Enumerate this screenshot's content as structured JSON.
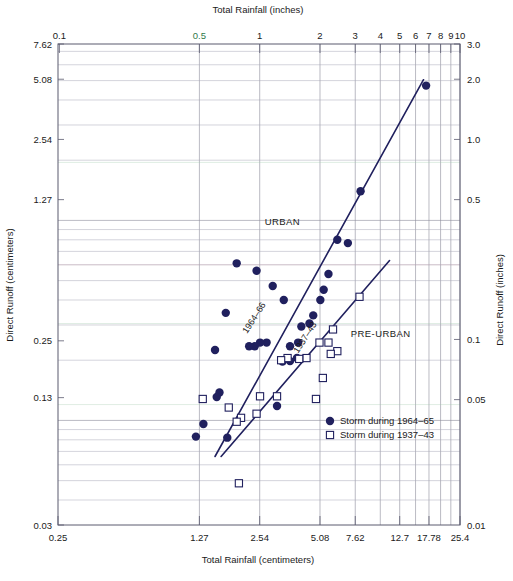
{
  "chart_data": {
    "type": "scatter",
    "title": "",
    "xlabel": "Total Rainfall (centimeters)",
    "xlabel_top": "Total Rainfall (inches)",
    "ylabel": "Direct Runoff (centimeters)",
    "ylabel_right": "Direct Runoff (inches)",
    "xscale": "log",
    "yscale": "log",
    "grid": true,
    "legend_position": "bottom-right",
    "xlim_cm": [
      0.25,
      25.4
    ],
    "ylim_cm": [
      0.03,
      7.62
    ],
    "xlim_in": [
      0.1,
      10
    ],
    "ylim_in": [
      0.01,
      3.0
    ],
    "x_ticks_bottom": [
      "0.25",
      "1.27",
      "2.54",
      "5.08",
      "7.62",
      "12.7",
      "17.78",
      "25.4"
    ],
    "x_ticks_bottom_vals": [
      0.25,
      1.27,
      2.54,
      5.08,
      7.62,
      12.7,
      17.78,
      25.4
    ],
    "x_ticks_top": [
      "0.1",
      "0.5",
      "1",
      "2",
      "3",
      "4",
      "5",
      "6",
      "7",
      "8",
      "9",
      "10"
    ],
    "x_ticks_top_vals": [
      0.1,
      0.5,
      1,
      2,
      3,
      4,
      5,
      6,
      7,
      8,
      9,
      10
    ],
    "y_ticks_left": [
      "7.62",
      "5.08",
      "2.54",
      "1.27",
      "0.25",
      "0.13",
      "0.03"
    ],
    "y_ticks_left_vals": [
      7.62,
      5.08,
      2.54,
      1.27,
      0.25,
      0.13,
      0.03
    ],
    "y_ticks_right": [
      "3.0",
      "2.0",
      "1.0",
      "0.5",
      "0.1",
      "0.05",
      "0.01"
    ],
    "y_ticks_right_vals": [
      3.0,
      2.0,
      1.0,
      0.5,
      0.1,
      0.05,
      0.01
    ],
    "annotations": [
      {
        "text": "URBAN",
        "x_cm": 3.3,
        "y_cm": 0.95
      },
      {
        "text": "PRE-URBAN",
        "x_cm": 10.2,
        "y_cm": 0.26
      },
      {
        "text": "1964–66",
        "x_cm": 2.45,
        "y_cm": 0.32,
        "rotated": true
      },
      {
        "text": "1937–43",
        "x_cm": 4.4,
        "y_cm": 0.255,
        "rotated": true
      }
    ],
    "series": [
      {
        "name": "Storm during 1964–65",
        "marker": "filled-circle",
        "color": "#20205e",
        "points_cm": [
          [
            17.2,
            4.72
          ],
          [
            8.1,
            1.4
          ],
          [
            7.0,
            0.77
          ],
          [
            6.2,
            0.8
          ],
          [
            5.6,
            0.54
          ],
          [
            5.3,
            0.45
          ],
          [
            5.1,
            0.4
          ],
          [
            4.7,
            0.335
          ],
          [
            4.5,
            0.305
          ],
          [
            4.1,
            0.295
          ],
          [
            3.95,
            0.245
          ],
          [
            3.6,
            0.235
          ],
          [
            3.9,
            0.205
          ],
          [
            3.6,
            0.198
          ],
          [
            3.3,
            0.197
          ],
          [
            2.95,
            0.47
          ],
          [
            3.35,
            0.4
          ],
          [
            2.45,
            0.56
          ],
          [
            1.95,
            0.61
          ],
          [
            2.75,
            0.245
          ],
          [
            2.55,
            0.245
          ],
          [
            2.4,
            0.235
          ],
          [
            2.25,
            0.235
          ],
          [
            1.72,
            0.345
          ],
          [
            1.52,
            0.225
          ],
          [
            3.1,
            0.118
          ],
          [
            1.6,
            0.138
          ],
          [
            1.55,
            0.131
          ],
          [
            1.33,
            0.096
          ],
          [
            1.22,
            0.083
          ],
          [
            1.75,
            0.082
          ]
        ]
      },
      {
        "name": "Storm during 1937–43",
        "marker": "open-square",
        "color": "#20205e",
        "points_cm": [
          [
            8.0,
            0.415
          ],
          [
            5.9,
            0.285
          ],
          [
            5.05,
            0.245
          ],
          [
            5.6,
            0.245
          ],
          [
            6.2,
            0.222
          ],
          [
            5.75,
            0.215
          ],
          [
            5.25,
            0.163
          ],
          [
            4.35,
            0.205
          ],
          [
            4.0,
            0.203
          ],
          [
            4.85,
            0.128
          ],
          [
            3.5,
            0.205
          ],
          [
            3.25,
            0.2
          ],
          [
            3.1,
            0.132
          ],
          [
            2.55,
            0.132
          ],
          [
            2.45,
            0.108
          ],
          [
            2.05,
            0.103
          ],
          [
            1.78,
            0.116
          ],
          [
            1.32,
            0.128
          ],
          [
            1.95,
            0.0985
          ],
          [
            2.0,
            0.0485
          ]
        ]
      }
    ],
    "fit_lines": [
      {
        "name": "urban-1964-66",
        "x0_cm": 1.52,
        "y0_cm": 0.066,
        "x1_cm": 16.7,
        "y1_cm": 5.05
      },
      {
        "name": "pre-urban-1937-43",
        "x0_cm": 1.63,
        "y0_cm": 0.066,
        "x1_cm": 11.3,
        "y1_cm": 0.63
      }
    ],
    "legend": [
      {
        "marker": "filled-circle",
        "label": "Storm during 1964–65"
      },
      {
        "marker": "open-square",
        "label": "Storm during 1937–43"
      }
    ],
    "colors": {
      "marker": "#20205e",
      "line": "#20205e",
      "grid": "#8b8b9a",
      "frame": "#5a5a6e",
      "text": "#1a1a1a",
      "tick_accent_green": "#2f7a4a"
    }
  }
}
